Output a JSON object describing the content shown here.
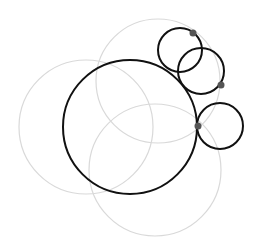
{
  "canvas": {
    "width": 261,
    "height": 248,
    "background": "#ffffff"
  },
  "colors": {
    "guide_stroke": "#d9d9d9",
    "main_stroke": "#111111",
    "point_fill": "#555555"
  },
  "guide_circles": [
    {
      "id": "left",
      "cx": 86,
      "cy": 127,
      "r": 67
    },
    {
      "id": "top",
      "cx": 158,
      "cy": 81,
      "r": 62
    },
    {
      "id": "bottom-right",
      "cx": 155,
      "cy": 170,
      "r": 66
    }
  ],
  "main_circles": [
    {
      "id": "large",
      "cx": 130,
      "cy": 127,
      "r": 67
    },
    {
      "id": "small-top",
      "cx": 180,
      "cy": 50,
      "r": 22
    },
    {
      "id": "small-middle",
      "cx": 201,
      "cy": 71,
      "r": 23
    },
    {
      "id": "small-right",
      "cx": 220,
      "cy": 126,
      "r": 23
    }
  ],
  "points": [
    {
      "id": "p1",
      "cx": 193,
      "cy": 33,
      "r": 3.5
    },
    {
      "id": "p2",
      "cx": 221,
      "cy": 85,
      "r": 3.5
    },
    {
      "id": "p3",
      "cx": 198,
      "cy": 126,
      "r": 3.5
    }
  ]
}
